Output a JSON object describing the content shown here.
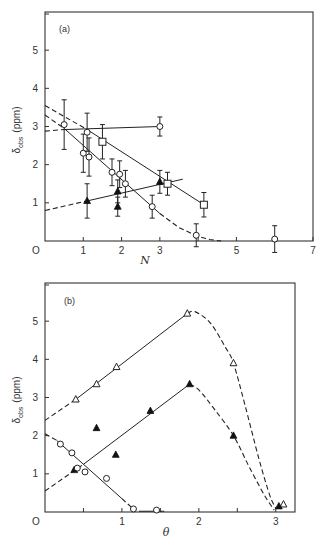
{
  "chart_data": [
    {
      "id": "a",
      "type": "scatter",
      "panel_label": "(a)",
      "xlabel": "N",
      "ylabel": "δobs (ppm)",
      "ylabel_main": "δ",
      "ylabel_sub": "obs",
      "ylabel_unit": "(ppm)",
      "xlim": [
        0,
        7
      ],
      "ylim": [
        0,
        6
      ],
      "xticks": [
        0,
        1,
        2,
        3,
        4,
        5,
        6,
        7
      ],
      "xticklabels": [
        "O",
        "1",
        "2",
        "3",
        "",
        "5",
        "",
        "7"
      ],
      "yticks": [
        1,
        2,
        3,
        4,
        5
      ],
      "yticklabels": [
        "1",
        "2",
        "3",
        "4",
        "5"
      ],
      "series": [
        {
          "name": "open circles",
          "marker": "circle-open",
          "points": [
            {
              "x": 0.5,
              "y": 3.05,
              "err": 0.65
            },
            {
              "x": 1.0,
              "y": 2.3,
              "err": 0.5
            },
            {
              "x": 1.1,
              "y": 2.85,
              "err": 0.5
            },
            {
              "x": 1.15,
              "y": 2.2,
              "err": 0.5
            },
            {
              "x": 1.75,
              "y": 1.8,
              "err": 0.35
            },
            {
              "x": 1.95,
              "y": 1.75,
              "err": 0.35
            },
            {
              "x": 2.1,
              "y": 1.5,
              "err": 0.35
            },
            {
              "x": 2.8,
              "y": 0.9,
              "err": 0.3
            },
            {
              "x": 3.0,
              "y": 3.0,
              "err": 0.25
            },
            {
              "x": 3.95,
              "y": 0.15,
              "err": 0.3
            },
            {
              "x": 6.0,
              "y": 0.05,
              "err": 0.35
            }
          ]
        },
        {
          "name": "open squares",
          "marker": "square-open",
          "points": [
            {
              "x": 1.5,
              "y": 2.6,
              "err": 0.45
            },
            {
              "x": 3.2,
              "y": 1.5,
              "err": 0.3
            },
            {
              "x": 4.15,
              "y": 0.95,
              "err": 0.32
            }
          ]
        },
        {
          "name": "filled triangles",
          "marker": "triangle-filled",
          "points": [
            {
              "x": 1.1,
              "y": 1.05,
              "err": 0.45
            },
            {
              "x": 1.9,
              "y": 1.3,
              "err": 0.3
            },
            {
              "x": 1.9,
              "y": 0.9,
              "err": 0.25
            },
            {
              "x": 3.0,
              "y": 1.55,
              "err": 0.3
            }
          ]
        }
      ],
      "lines": [
        {
          "name": "flat-line-dashed",
          "style": "dashed",
          "points": [
            [
              0,
              2.88
            ],
            [
              0.5,
              2.92
            ]
          ]
        },
        {
          "name": "flat-line",
          "style": "solid",
          "points": [
            [
              0.5,
              2.92
            ],
            [
              3.0,
              3.0
            ]
          ]
        },
        {
          "name": "square-fit-dashed",
          "style": "dashed",
          "points": [
            [
              0,
              3.55
            ],
            [
              1.1,
              2.92
            ]
          ]
        },
        {
          "name": "square-fit",
          "style": "solid",
          "points": [
            [
              1.1,
              2.92
            ],
            [
              4.15,
              0.95
            ]
          ]
        },
        {
          "name": "circle-fit-dashed-start",
          "style": "dashed",
          "points": [
            [
              0,
              3.3
            ],
            [
              0.5,
              2.95
            ]
          ]
        },
        {
          "name": "circle-fit",
          "style": "solid",
          "points": [
            [
              0.5,
              2.95
            ],
            [
              3.0,
              0.72
            ]
          ]
        },
        {
          "name": "circle-fit-dashed-tail",
          "style": "dashed",
          "points": [
            [
              3.0,
              0.72
            ],
            [
              3.5,
              0.35
            ],
            [
              4.0,
              0.12
            ],
            [
              4.3,
              0.04
            ],
            [
              4.6,
              0.0
            ]
          ]
        },
        {
          "name": "triangle-fit-dashed",
          "style": "dashed",
          "points": [
            [
              0,
              0.8
            ],
            [
              1.1,
              1.05
            ]
          ]
        },
        {
          "name": "triangle-fit",
          "style": "solid",
          "points": [
            [
              1.1,
              1.05
            ],
            [
              3.6,
              1.62
            ]
          ]
        }
      ]
    },
    {
      "id": "b",
      "type": "scatter",
      "panel_label": "(b)",
      "xlabel": "θ",
      "ylabel": "δobs (ppm)",
      "ylabel_main": "δ",
      "ylabel_sub": "obs",
      "ylabel_unit": "(ppm)",
      "xlim": [
        0,
        3.25
      ],
      "ylim": [
        0,
        6
      ],
      "xticks": [
        0,
        0.5,
        1,
        1.5,
        2,
        2.5,
        3
      ],
      "xticklabels": [
        "O",
        "",
        "1",
        "",
        "2",
        "",
        "3"
      ],
      "yticks": [
        1,
        2,
        3,
        4,
        5
      ],
      "yticklabels": [
        "1",
        "2",
        "3",
        "4",
        "5"
      ],
      "series": [
        {
          "name": "open triangles",
          "marker": "triangle-open",
          "points": [
            {
              "x": 0.4,
              "y": 2.95
            },
            {
              "x": 0.67,
              "y": 3.35
            },
            {
              "x": 0.93,
              "y": 3.8
            },
            {
              "x": 1.85,
              "y": 5.2
            },
            {
              "x": 2.45,
              "y": 3.9
            },
            {
              "x": 3.1,
              "y": 0.2
            }
          ]
        },
        {
          "name": "filled triangles",
          "marker": "triangle-filled",
          "points": [
            {
              "x": 0.38,
              "y": 1.1
            },
            {
              "x": 0.67,
              "y": 2.2
            },
            {
              "x": 0.92,
              "y": 1.5
            },
            {
              "x": 1.37,
              "y": 2.65
            },
            {
              "x": 1.88,
              "y": 3.35
            },
            {
              "x": 2.45,
              "y": 2.0
            },
            {
              "x": 3.04,
              "y": 0.15
            }
          ]
        },
        {
          "name": "open circles",
          "marker": "circle-open",
          "points": [
            {
              "x": 0.2,
              "y": 1.78
            },
            {
              "x": 0.35,
              "y": 1.55
            },
            {
              "x": 0.42,
              "y": 1.15
            },
            {
              "x": 0.52,
              "y": 1.05
            },
            {
              "x": 0.8,
              "y": 0.88
            },
            {
              "x": 1.15,
              "y": 0.08
            },
            {
              "x": 1.45,
              "y": 0.05
            }
          ]
        }
      ],
      "lines": [
        {
          "name": "upper-fit-dashed",
          "style": "dashed",
          "points": [
            [
              0,
              2.4
            ],
            [
              0.4,
              2.95
            ]
          ]
        },
        {
          "name": "upper-fit",
          "style": "solid",
          "points": [
            [
              0.4,
              2.95
            ],
            [
              1.85,
              5.2
            ]
          ]
        },
        {
          "name": "upper-fit-decay",
          "style": "dashed",
          "smooth": true,
          "points": [
            [
              1.85,
              5.2
            ],
            [
              1.95,
              5.25
            ],
            [
              2.15,
              4.95
            ],
            [
              2.35,
              4.3
            ],
            [
              2.45,
              3.9
            ],
            [
              2.6,
              2.8
            ],
            [
              2.78,
              1.4
            ],
            [
              2.92,
              0.45
            ],
            [
              3.0,
              0.1
            ]
          ]
        },
        {
          "name": "middle-fit-dashed",
          "style": "dashed",
          "points": [
            [
              0,
              0.55
            ],
            [
              0.5,
              1.25
            ]
          ]
        },
        {
          "name": "middle-fit",
          "style": "solid",
          "points": [
            [
              0.5,
              1.25
            ],
            [
              1.88,
              3.35
            ]
          ]
        },
        {
          "name": "middle-fit-decay",
          "style": "dashed",
          "smooth": true,
          "points": [
            [
              1.88,
              3.35
            ],
            [
              2.0,
              3.2
            ],
            [
              2.2,
              2.7
            ],
            [
              2.45,
              2.0
            ],
            [
              2.65,
              1.2
            ],
            [
              2.85,
              0.45
            ],
            [
              2.98,
              0.05
            ]
          ]
        },
        {
          "name": "circle-fit-dashed-start",
          "style": "dashed",
          "points": [
            [
              0,
              2.05
            ],
            [
              0.15,
              1.88
            ]
          ]
        },
        {
          "name": "circle-fit",
          "style": "solid",
          "points": [
            [
              0.15,
              1.88
            ],
            [
              1.0,
              0.35
            ]
          ]
        },
        {
          "name": "circle-fit-dashed-tail",
          "style": "dashed",
          "points": [
            [
              1.0,
              0.35
            ],
            [
              1.18,
              0.02
            ]
          ]
        },
        {
          "name": "circle-baseline",
          "style": "solid",
          "points": [
            [
              1.22,
              0.02
            ],
            [
              1.55,
              0.02
            ]
          ]
        }
      ]
    }
  ]
}
